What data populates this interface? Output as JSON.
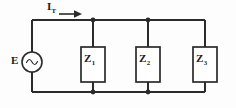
{
  "figure": {
    "background_color": "#fdfdfd",
    "line_color": "#2b2b2b",
    "text_color": "#1a1a1a"
  },
  "labels": {
    "total_current": {
      "symbol": "I",
      "subscript": "T"
    },
    "source": {
      "symbol": "E",
      "subscript": ""
    },
    "impedance_1": {
      "symbol": "Z",
      "subscript": "1"
    },
    "impedance_2": {
      "symbol": "Z",
      "subscript": "2"
    },
    "impedance_3": {
      "symbol": "Z",
      "subscript": "3"
    }
  },
  "components": {
    "source": {
      "type": "ac-voltage-source",
      "symbol_inside": "~",
      "shape": "circle",
      "center_x": 32,
      "center_y": 62,
      "radius": 10
    },
    "impedances": [
      {
        "name": "Z1",
        "x": 81,
        "y": 47,
        "width": 24,
        "height": 35
      },
      {
        "name": "Z2",
        "x": 136,
        "y": 47,
        "width": 24,
        "height": 35
      },
      {
        "name": "Z3",
        "x": 193,
        "y": 47,
        "width": 24,
        "height": 35
      }
    ]
  },
  "wiring": {
    "top_rail_y": 20,
    "bottom_rail_y": 92,
    "left_rail_x": 32,
    "right_rail_x": 205,
    "branch_x": [
      93,
      148,
      205
    ],
    "junction_dots": [
      {
        "x": 93,
        "y": 20
      },
      {
        "x": 148,
        "y": 20
      },
      {
        "x": 93,
        "y": 92
      },
      {
        "x": 148,
        "y": 92
      }
    ],
    "current_arrow": {
      "direction": "right",
      "x_start": 59,
      "x_end": 81,
      "y": 14
    }
  }
}
